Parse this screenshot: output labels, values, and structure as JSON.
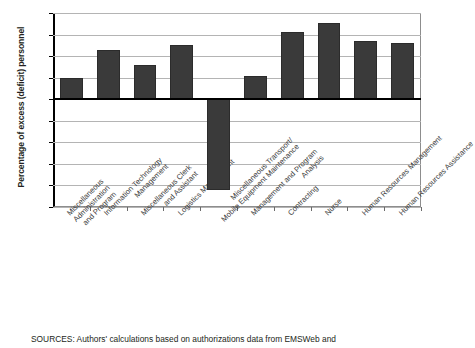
{
  "chart_data": {
    "type": "bar",
    "title": "",
    "xlabel": "",
    "ylabel": "Percentage of excess (deficit) personnel",
    "ylim": [
      -50,
      40
    ],
    "ytick_values": [
      40,
      30,
      20,
      10,
      0,
      -10,
      -20,
      -30,
      -40,
      -50
    ],
    "ytick_labels": [
      "40",
      "30",
      "20",
      "10",
      "0",
      "–10",
      "–20",
      "–30",
      "–40",
      "–50"
    ],
    "grid": true,
    "legend": "none",
    "bar_color": "#3a3a3a",
    "categories": [
      "Miscellaneous Administration and Program",
      "Information Technology Management",
      "Miscellaneous Clerk and Assistant",
      "Logistics Management",
      "Miscellaneous Transport/ Mobile Equipment Maintenance",
      "Management and Program Analysis",
      "Contracting",
      "Nurse",
      "Human Resources Management",
      "Human Resources Assistance"
    ],
    "category_lines": [
      [
        "Miscellaneous",
        "Administration",
        "and Program"
      ],
      [
        "Information Technology",
        "Management"
      ],
      [
        "Miscellaneous Clerk",
        "and Assistant"
      ],
      [
        "Logistics Management"
      ],
      [
        "Miscellaneous Transport/",
        "Mobile Equipment Maintenance"
      ],
      [
        "Management and Program",
        "Analysis"
      ],
      [
        "Contracting"
      ],
      [
        "Nurse"
      ],
      [
        "Human Resources Management"
      ],
      [
        "Human Resources Assistance"
      ]
    ],
    "values": [
      10,
      23,
      16,
      25,
      -42,
      11,
      31,
      35.5,
      27,
      26
    ]
  },
  "source": {
    "note": "SOURCES: Authors' calculations based on authorizations data from EMSWeb and"
  }
}
